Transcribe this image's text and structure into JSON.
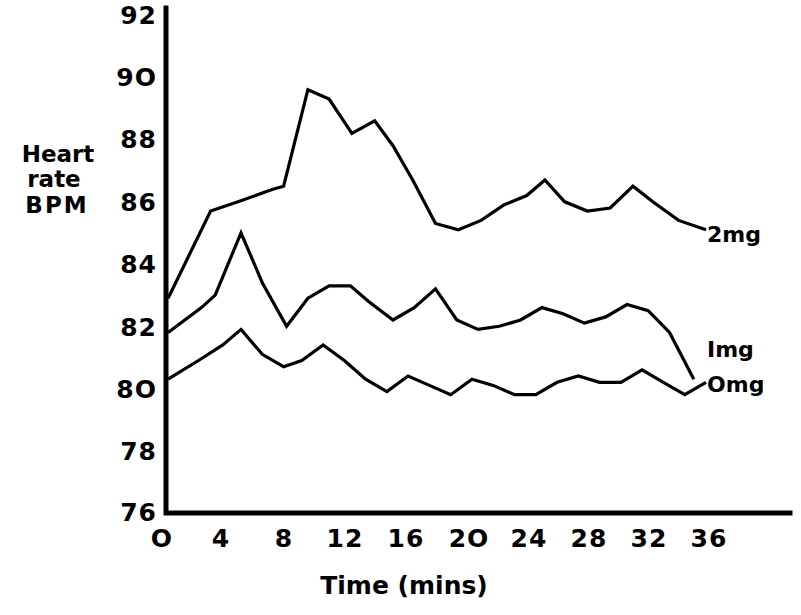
{
  "chart_data": {
    "type": "line",
    "title": "",
    "subtitle": "",
    "xlabel": "Time  (mins)",
    "ylabel": "Heart rate BPM",
    "ylabel_lines": [
      "Heart",
      "rate",
      "BPM"
    ],
    "xlim": [
      0,
      37
    ],
    "ylim": [
      76,
      92
    ],
    "grid": false,
    "legend_position": "right-inline",
    "xticks": [
      0,
      4,
      8,
      12,
      16,
      20,
      24,
      28,
      32,
      36
    ],
    "xtick_labels": [
      "O",
      "4",
      "8",
      "12",
      "16",
      "2O",
      "24",
      "28",
      "32",
      "36"
    ],
    "yticks": [
      76,
      78,
      80,
      82,
      84,
      86,
      88,
      90,
      92
    ],
    "ytick_labels": [
      "76",
      "78",
      "8O",
      "82",
      "84",
      "86",
      "88",
      "9O",
      "92"
    ],
    "series": [
      {
        "name": "2mg",
        "label": "2mg",
        "x": [
          0.4,
          3.2,
          5.0,
          7.3,
          8.0,
          9.6,
          11.0,
          12.5,
          14.0,
          15.2,
          16.5,
          18.0,
          19.5,
          21.0,
          22.5,
          24.0,
          25.2,
          26.5,
          28.0,
          29.5,
          31.0,
          32.3,
          34.0,
          35.8
        ],
        "y": [
          82.9,
          85.7,
          86.0,
          86.4,
          86.5,
          89.6,
          89.3,
          88.2,
          88.6,
          87.8,
          86.7,
          85.3,
          85.1,
          85.4,
          85.9,
          86.2,
          86.7,
          86.0,
          85.7,
          85.8,
          86.5,
          86.0,
          85.4,
          85.1
        ]
      },
      {
        "name": "1mg",
        "label": "Img",
        "x": [
          0.4,
          2.6,
          3.5,
          5.2,
          6.6,
          8.2,
          9.6,
          11.0,
          12.4,
          13.6,
          15.2,
          16.6,
          18.0,
          19.4,
          20.8,
          22.2,
          23.6,
          25.0,
          26.4,
          27.8,
          29.2,
          30.6,
          32.0,
          33.4,
          35.0
        ],
        "y": [
          81.8,
          82.6,
          83.0,
          85.0,
          83.4,
          82.0,
          82.9,
          83.3,
          83.3,
          82.8,
          82.2,
          82.6,
          83.2,
          82.2,
          81.9,
          82.0,
          82.2,
          82.6,
          82.4,
          82.1,
          82.3,
          82.7,
          82.5,
          81.8,
          80.3
        ]
      },
      {
        "name": "0mg",
        "label": "Omg",
        "x": [
          0.4,
          2.4,
          4.0,
          5.2,
          6.6,
          8.0,
          9.2,
          10.6,
          12.0,
          13.4,
          14.8,
          16.2,
          17.6,
          19.0,
          20.4,
          21.8,
          23.2,
          24.6,
          26.0,
          27.4,
          28.8,
          30.2,
          31.6,
          33.0,
          34.4,
          35.8
        ],
        "y": [
          80.3,
          80.9,
          81.4,
          81.9,
          81.1,
          80.7,
          80.9,
          81.4,
          80.9,
          80.3,
          79.9,
          80.4,
          80.1,
          79.8,
          80.3,
          80.1,
          79.8,
          79.8,
          80.2,
          80.4,
          80.2,
          80.2,
          80.6,
          80.2,
          79.8,
          80.2
        ]
      }
    ]
  },
  "axis": {
    "x_title": "Time  (mins)",
    "y_title_line1": "Heart",
    "y_title_line2": "rate",
    "y_title_line3": "BPM"
  },
  "colors": {
    "line": "#000000",
    "background": "#ffffff",
    "axis": "#000000"
  }
}
